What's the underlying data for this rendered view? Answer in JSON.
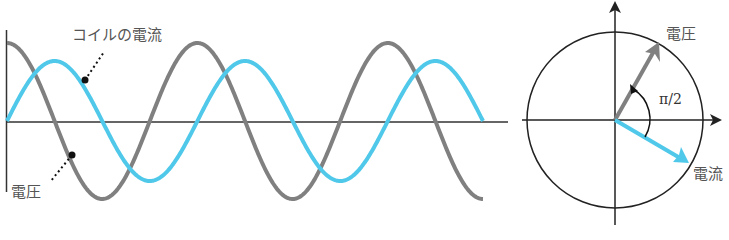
{
  "waveform": {
    "voltage_label": "電圧",
    "current_label": "コイルの電流",
    "colors": {
      "voltage": "#808080",
      "current": "#4fc8ea",
      "axis": "#333333"
    }
  },
  "phasor": {
    "voltage_label": "電圧",
    "current_label": "電流",
    "angle_label": "π/2"
  },
  "chart_data": {
    "type": "line",
    "title": "",
    "xlabel": "",
    "ylabel": "",
    "series": [
      {
        "name": "電圧",
        "form": "cos",
        "amplitude": 1.27,
        "periods": 2.5
      },
      {
        "name": "コイルの電流",
        "form": "sin",
        "amplitude": 1.0,
        "periods": 2.5
      }
    ],
    "phase_difference": "π/2 (voltage leads current)"
  }
}
